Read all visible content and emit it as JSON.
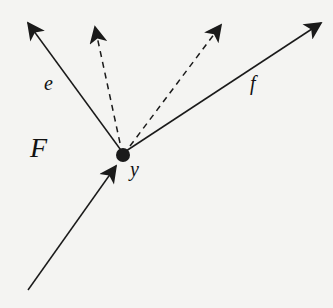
{
  "labels": {
    "edge_e": "e",
    "edge_f": "f",
    "region_F": "F",
    "node_y": "y"
  },
  "colors": {
    "stroke": "#1a1a1a",
    "background": "#f4f4f2"
  }
}
